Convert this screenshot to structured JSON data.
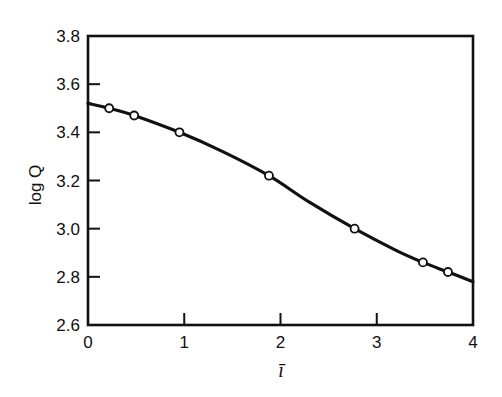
{
  "chart_data": {
    "type": "line",
    "title": "",
    "xlabel": "ī",
    "ylabel": "log Q",
    "xlim": [
      0,
      4
    ],
    "ylim": [
      2.6,
      3.8
    ],
    "x_ticks": [
      0,
      1,
      2,
      3,
      4
    ],
    "x_tick_labels": [
      "0",
      "1",
      "2",
      "3",
      "4"
    ],
    "y_ticks": [
      2.6,
      2.8,
      3.0,
      3.2,
      3.4,
      3.6,
      3.8
    ],
    "y_tick_labels": [
      "2.6",
      "2.8",
      "3.0",
      "3.2",
      "3.4",
      "3.6",
      "3.8"
    ],
    "grid": false,
    "legend": null,
    "series": [
      {
        "name": "fitted curve",
        "style": "solid line",
        "x": [
          0,
          0.22,
          0.48,
          0.95,
          1.4,
          1.88,
          2.3,
          2.77,
          3.2,
          3.48,
          3.74,
          4.0
        ],
        "y": [
          3.52,
          3.5,
          3.47,
          3.4,
          3.32,
          3.22,
          3.11,
          3.0,
          2.91,
          2.86,
          2.82,
          2.78
        ]
      },
      {
        "name": "data points",
        "style": "open circles",
        "x": [
          0.22,
          0.48,
          0.95,
          1.88,
          2.77,
          3.48,
          3.74
        ],
        "y": [
          3.5,
          3.47,
          3.4,
          3.22,
          3.0,
          2.86,
          2.82
        ]
      }
    ]
  }
}
